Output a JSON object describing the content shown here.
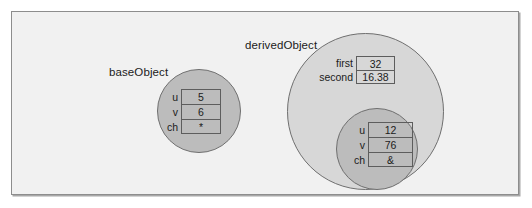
{
  "figure": {
    "background_color": "#f1f1f1",
    "frame_border_color": "#8d8d8d",
    "circle_fill_dark": "#bcbcbc",
    "circle_fill_light": "#d7d7d7",
    "circle_border_color": "#6f6f6f"
  },
  "base_object": {
    "label": "baseObject",
    "members": [
      {
        "name": "u",
        "value": "5"
      },
      {
        "name": "v",
        "value": "6"
      },
      {
        "name": "ch",
        "value": "*"
      }
    ]
  },
  "derived_object": {
    "label": "derivedObject",
    "members": [
      {
        "name": "first",
        "value": "32"
      },
      {
        "name": "second",
        "value": "16.38"
      }
    ],
    "base_subobject": {
      "members": [
        {
          "name": "u",
          "value": "12"
        },
        {
          "name": "v",
          "value": "76"
        },
        {
          "name": "ch",
          "value": "&"
        }
      ]
    }
  }
}
